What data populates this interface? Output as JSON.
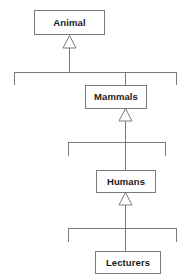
{
  "diagram": {
    "kind": "uml-class-inheritance-hierarchy",
    "background_color": "#ffffff",
    "line_color": "#7a7a7a",
    "box_fill_color": "#ffffff",
    "text_color": "#1a1a1a",
    "classes": [
      {
        "id": "animal",
        "label": "Animal",
        "level": 0
      },
      {
        "id": "mammals",
        "label": "Mammals",
        "level": 1
      },
      {
        "id": "humans",
        "label": "Humans",
        "level": 2
      },
      {
        "id": "lecturers",
        "label": "Lecturers",
        "level": 3
      }
    ],
    "generalizations": [
      {
        "child": "mammals",
        "parent": "animal"
      },
      {
        "child": "humans",
        "parent": "mammals"
      },
      {
        "child": "lecturers",
        "parent": "humans"
      }
    ]
  }
}
